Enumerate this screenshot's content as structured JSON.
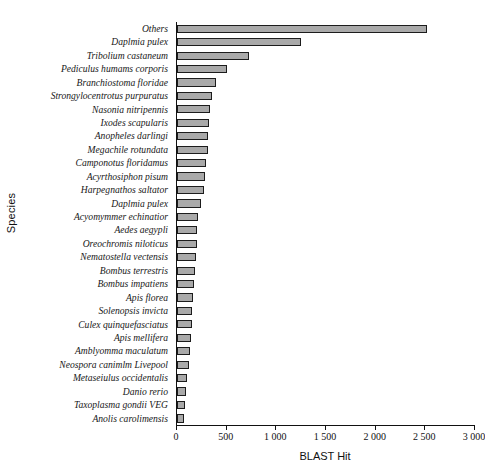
{
  "chart_data": {
    "type": "bar",
    "orientation": "horizontal",
    "title": "",
    "xlabel": "BLAST Hit",
    "ylabel": "Species",
    "xlim": [
      0,
      3000
    ],
    "grid": false,
    "legend": null,
    "xticks": [
      0,
      500,
      1000,
      1500,
      2000,
      2500,
      3000
    ],
    "xtick_labels": [
      "0",
      "500",
      "1 000",
      "1 500",
      "2 000",
      "2 500",
      "3 000"
    ],
    "bar_color": "#a9a9a9",
    "bar_edge_color": "#1c1c1c",
    "categories": [
      "Others",
      "Daplmia pulex",
      "Tribolium castaneum",
      "Pediculus humams corporis",
      "Branchiostoma floridae",
      "Strongylocentrotus purpuratus",
      "Nasonia nitripennis",
      "Ixodes scapularis",
      "Anopheles darlingi",
      "Megachile rotundata",
      "Camponotus floridamus",
      "Acyrthosiphon pisum",
      "Harpegnathos saltator",
      "Daplmia pulex",
      "Acyomymmer echinatior",
      "Aedes aegypli",
      "Oreochromis niloticus",
      "Nematostella vectensis",
      "Bombus terrestris",
      "Bombus impatiens",
      "Apis florea",
      "Solenopsis invicta",
      "Culex quinquefasciatus",
      "Apis mellifera",
      "Amblyomma maculatum",
      "Neospora canimlm Livepool",
      "Metaseiulus occidentalis",
      "Danio rerio",
      "Taxoplasma gondii VEG",
      "Anolis carolimensis"
    ],
    "values": [
      2520,
      1250,
      725,
      500,
      392,
      350,
      330,
      320,
      315,
      310,
      295,
      280,
      270,
      240,
      215,
      205,
      200,
      190,
      180,
      175,
      165,
      155,
      150,
      145,
      135,
      120,
      105,
      95,
      85,
      70
    ]
  }
}
